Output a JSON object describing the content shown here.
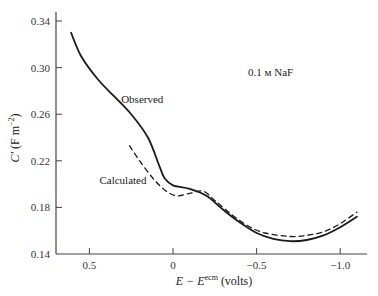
{
  "chart_data": {
    "type": "line",
    "title": "",
    "xlabel": "E − E^ecm (volts)",
    "xlabel_main": "E − E",
    "xlabel_sup": "ecm",
    "xlabel_unit": "(volts)",
    "ylabel": "C′ (F m⁻²)",
    "ylabel_main": "C′ (F m",
    "ylabel_sup": "−2",
    "ylabel_end": ")",
    "xlim": [
      0.7,
      -1.17
    ],
    "ylim": [
      0.14,
      0.35
    ],
    "x_reversed": true,
    "grid": false,
    "legend_position": "inline-labels",
    "xticks": [
      0.5,
      0,
      -0.5,
      -1.0
    ],
    "xtick_labels": [
      "0.5",
      "0",
      "−0.5",
      "−1.0"
    ],
    "yticks": [
      0.14,
      0.18,
      0.22,
      0.26,
      0.3,
      0.34
    ],
    "ytick_labels": [
      "0.14",
      "0.18",
      "0.22",
      "0.26",
      "0.30",
      "0.34"
    ],
    "annotations": [
      {
        "text": "0.1 м NaF",
        "x": -0.55,
        "y": 0.305
      }
    ],
    "series": [
      {
        "name": "Observed",
        "style": "solid",
        "color": "#1a1a1a",
        "label_pos": {
          "x": 0.31,
          "y": 0.27
        },
        "x": [
          0.61,
          0.55,
          0.45,
          0.35,
          0.25,
          0.15,
          0.08,
          0.05,
          0.0,
          -0.1,
          -0.2,
          -0.3,
          -0.4,
          -0.5,
          -0.6,
          -0.7,
          -0.8,
          -0.9,
          -1.0,
          -1.1
        ],
        "values": [
          0.33,
          0.31,
          0.29,
          0.275,
          0.26,
          0.24,
          0.215,
          0.205,
          0.199,
          0.196,
          0.19,
          0.178,
          0.167,
          0.158,
          0.153,
          0.151,
          0.152,
          0.156,
          0.163,
          0.172
        ]
      },
      {
        "name": "Calculated",
        "style": "dashed",
        "color": "#1a1a1a",
        "label_pos": {
          "x": 0.44,
          "y": 0.2
        },
        "x": [
          0.26,
          0.2,
          0.12,
          0.05,
          -0.02,
          -0.1,
          -0.18,
          -0.25,
          -0.35,
          -0.45,
          -0.55,
          -0.7,
          -0.8,
          -0.9,
          -1.0,
          -1.1
        ],
        "values": [
          0.233,
          0.22,
          0.205,
          0.195,
          0.19,
          0.192,
          0.194,
          0.186,
          0.174,
          0.164,
          0.158,
          0.155,
          0.156,
          0.159,
          0.166,
          0.176
        ]
      }
    ]
  },
  "labels": {
    "annotation": "0.1 м NaF",
    "observed": "Observed",
    "calculated": "Calculated"
  }
}
